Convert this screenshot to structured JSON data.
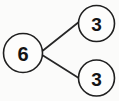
{
  "diagram": {
    "type": "number-bond",
    "background_color": "#fbfbfa",
    "stroke_color": "#1f1f1f",
    "text_color": "#141414",
    "whole": {
      "label": "6",
      "name": "whole",
      "cx": 23,
      "cy": 53,
      "r": 19.5
    },
    "parts": [
      {
        "label": "3",
        "name": "part-top",
        "cx": 96.5,
        "cy": 23.5,
        "r": 18
      },
      {
        "label": "3",
        "name": "part-bottom",
        "cx": 96.5,
        "cy": 78,
        "r": 18
      }
    ],
    "links": [
      {
        "name": "link-whole-to-part-top",
        "x1": 43,
        "y1": 50.5,
        "x2": 79.5,
        "y2": 21.5
      },
      {
        "name": "link-whole-to-part-bottom",
        "x1": 43,
        "y1": 55.5,
        "x2": 79.5,
        "y2": 78.5
      }
    ]
  }
}
